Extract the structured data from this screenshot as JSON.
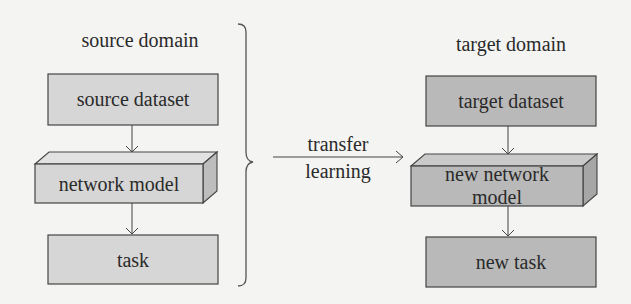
{
  "diagram": {
    "source": {
      "title": "source domain",
      "dataset": "source dataset",
      "model": "network model",
      "task": "task"
    },
    "target": {
      "title": "target domain",
      "dataset": "target dataset",
      "model_line1": "new network",
      "model_line2": "model",
      "task": "new task"
    },
    "transfer": {
      "line1": "transfer",
      "line2": "learning"
    },
    "colors": {
      "background": "#f4f4f2",
      "source_fill": "#d6d6d6",
      "source_side": "#c4c4c4",
      "target_fill": "#b9b9b9",
      "target_side": "#a8a8a8",
      "stroke": "#444444"
    }
  }
}
